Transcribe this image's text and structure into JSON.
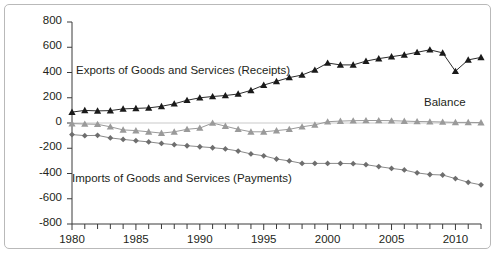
{
  "chart_data": {
    "type": "line",
    "title": "",
    "subtitle": "",
    "xlabel": "",
    "ylabel": "",
    "xlim": [
      1980,
      2012
    ],
    "ylim": [
      -800,
      800
    ],
    "ytick_step": 200,
    "xtick_step": 1,
    "xtick_label_step": 5,
    "grid": false,
    "legend_position": "inline-annotations",
    "x": [
      1980,
      1981,
      1982,
      1983,
      1984,
      1985,
      1986,
      1987,
      1988,
      1989,
      1990,
      1991,
      1992,
      1993,
      1994,
      1995,
      1996,
      1997,
      1998,
      1999,
      2000,
      2001,
      2002,
      2003,
      2004,
      2005,
      2006,
      2007,
      2008,
      2009,
      2010,
      2011,
      2012
    ],
    "yticklabels": [
      "800",
      "600",
      "400",
      "200",
      "0",
      "-200",
      "-400",
      "-600",
      "-800"
    ],
    "yticks": [
      800,
      600,
      400,
      200,
      0,
      -200,
      -400,
      -600,
      -800
    ],
    "xticklabels": [
      "1980",
      "1985",
      "1990",
      "1995",
      "2000",
      "2005",
      "2010"
    ],
    "xticks": [
      1980,
      1985,
      1990,
      1995,
      2000,
      2005,
      2010
    ],
    "series": [
      {
        "name": "Exports of Goods and Services (Receipts)",
        "marker": "triangle",
        "color": "#1a1a1a",
        "line_color": "#2b2b2b",
        "values": [
          86,
          100,
          96,
          98,
          112,
          116,
          120,
          132,
          152,
          180,
          200,
          210,
          218,
          230,
          258,
          300,
          330,
          360,
          380,
          420,
          475,
          460,
          460,
          490,
          510,
          525,
          540,
          560,
          580,
          555,
          410,
          500,
          520
        ]
      },
      {
        "name": "Balance",
        "marker": "triangle",
        "color": "#9a9a9a",
        "line_color": "#9a9a9a",
        "values": [
          -5,
          -8,
          -10,
          -30,
          -55,
          -60,
          -70,
          -80,
          -70,
          -50,
          -40,
          0,
          -25,
          -50,
          -70,
          -70,
          -60,
          -50,
          -30,
          -15,
          10,
          15,
          18,
          20,
          20,
          18,
          15,
          12,
          10,
          8,
          5,
          5,
          3
        ]
      },
      {
        "name": "Imports of Goods and Services (Payments)",
        "marker": "diamond",
        "color": "#6e6e6e",
        "line_color": "#8a8a8a",
        "values": [
          -92,
          -100,
          -98,
          -118,
          -130,
          -140,
          -150,
          -162,
          -172,
          -180,
          -188,
          -196,
          -205,
          -222,
          -245,
          -260,
          -285,
          -300,
          -320,
          -320,
          -320,
          -320,
          -322,
          -330,
          -345,
          -360,
          -372,
          -395,
          -408,
          -412,
          -440,
          -470,
          -490
        ]
      }
    ],
    "annotations": [
      {
        "text": "Exports of Goods and Services (Receipts)",
        "x": 76,
        "y": 64
      },
      {
        "text": "Balance",
        "x": 424,
        "y": 96
      },
      {
        "text": "Imports of Goods and Services (Payments)",
        "x": 72,
        "y": 172
      }
    ]
  }
}
